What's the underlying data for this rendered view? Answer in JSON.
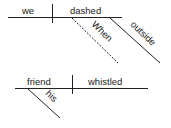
{
  "diagram": {
    "type": "sentence-diagram",
    "sentence1": {
      "subject": "we",
      "verb": "dashed",
      "modifiers": [
        {
          "word": "When",
          "line": "dashed"
        },
        {
          "word": "outside",
          "line": "solid"
        }
      ]
    },
    "sentence2": {
      "subject": "friend",
      "verb": "whistled",
      "modifiers": [
        {
          "word": "his",
          "line": "solid"
        }
      ]
    },
    "colors": {
      "line": "#222222",
      "background": "#ffffff"
    }
  }
}
